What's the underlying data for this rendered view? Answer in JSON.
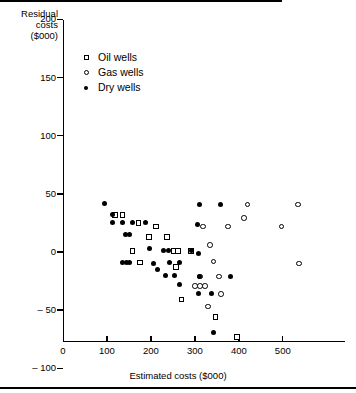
{
  "chart_data": {
    "type": "scatter",
    "title": "",
    "xlabel": "Estimated costs ($000)",
    "ylabel": "Residual costs ($000)",
    "ylabel_lines": [
      "Residual",
      "costs",
      "($000)"
    ],
    "xlim": [
      0,
      545
    ],
    "ylim": [
      -100,
      210
    ],
    "xticks": [
      0,
      100,
      200,
      300,
      400,
      500
    ],
    "yticks": [
      -100,
      -50,
      0,
      50,
      100,
      150,
      200
    ],
    "xtick_labels": [
      "0",
      "100",
      "200",
      "300",
      "400",
      "500"
    ],
    "ytick_labels": [
      "– 100",
      "– 50",
      "0",
      "50",
      "100",
      "150",
      "200"
    ],
    "grid": false,
    "zero_reference_line": 0,
    "legend_position": "upper-left-inside",
    "legend": [
      {
        "label": "Oil wells",
        "marker": "open-square"
      },
      {
        "label": "Gas wells",
        "marker": "open-circle"
      },
      {
        "label": "Dry wells",
        "marker": "filled-circle"
      }
    ],
    "series": [
      {
        "name": "Oil wells",
        "marker": "open-square",
        "points": [
          [
            118,
            32
          ],
          [
            135,
            32
          ],
          [
            172,
            25
          ],
          [
            211,
            22
          ],
          [
            196,
            13
          ],
          [
            237,
            13
          ],
          [
            158,
            1
          ],
          [
            252,
            1
          ],
          [
            262,
            1
          ],
          [
            291,
            1
          ],
          [
            175,
            -9
          ],
          [
            257,
            -13
          ],
          [
            270,
            -41
          ],
          [
            347,
            -56
          ],
          [
            396,
            -73
          ]
        ]
      },
      {
        "name": "Gas wells",
        "marker": "open-circle",
        "points": [
          [
            420,
            41
          ],
          [
            535,
            41
          ],
          [
            412,
            29
          ],
          [
            375,
            22
          ],
          [
            497,
            22
          ],
          [
            318,
            22
          ],
          [
            334,
            6
          ],
          [
            342,
            -8
          ],
          [
            311,
            -21
          ],
          [
            355,
            -21
          ],
          [
            300,
            -29
          ],
          [
            312,
            -29
          ],
          [
            323,
            -29
          ],
          [
            360,
            -36
          ],
          [
            330,
            -47
          ],
          [
            537,
            -10
          ]
        ]
      },
      {
        "name": "Dry wells",
        "marker": "filled-circle",
        "points": [
          [
            95,
            42
          ],
          [
            113,
            32
          ],
          [
            113,
            25
          ],
          [
            135,
            25
          ],
          [
            158,
            25
          ],
          [
            188,
            25
          ],
          [
            143,
            15
          ],
          [
            151,
            15
          ],
          [
            196,
            3
          ],
          [
            229,
            1
          ],
          [
            240,
            1
          ],
          [
            292,
            1
          ],
          [
            136,
            -9
          ],
          [
            145,
            -9
          ],
          [
            152,
            -9
          ],
          [
            205,
            -10
          ],
          [
            243,
            -9
          ],
          [
            265,
            -9
          ],
          [
            216,
            -15
          ],
          [
            234,
            -20
          ],
          [
            253,
            -20
          ],
          [
            311,
            -21
          ],
          [
            382,
            -21
          ],
          [
            264,
            -28
          ],
          [
            309,
            -36
          ],
          [
            338,
            -36
          ],
          [
            308,
            -1
          ],
          [
            359,
            41
          ],
          [
            311,
            41
          ],
          [
            307,
            24
          ],
          [
            343,
            -69
          ]
        ]
      }
    ]
  }
}
